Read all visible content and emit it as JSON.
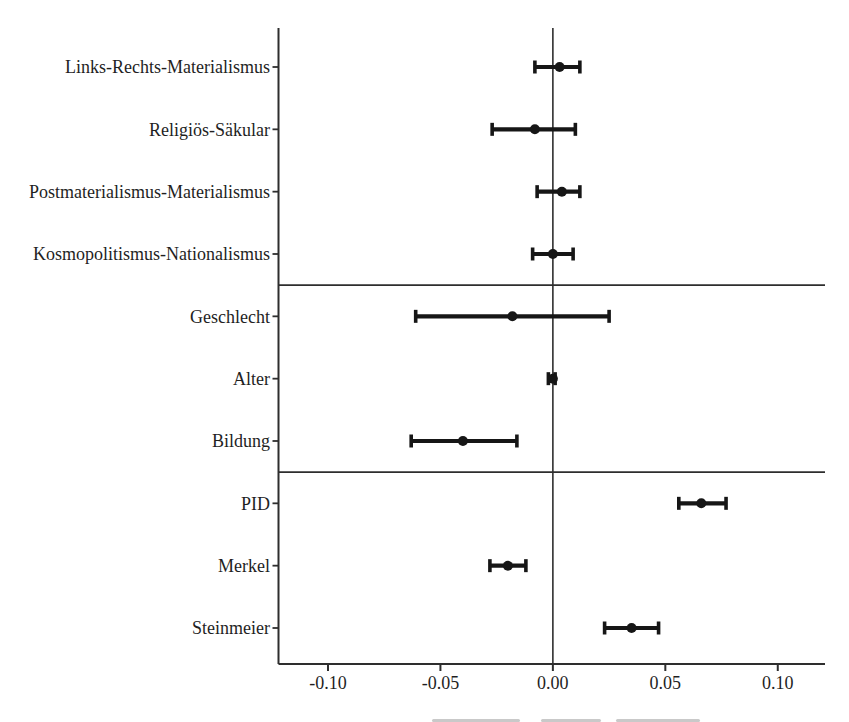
{
  "figure": {
    "background": "#ffffff",
    "ink_color": "#161616",
    "axis_line_color": "#2e2e2e",
    "text_color": "#1f1f1f"
  },
  "chart_data": {
    "type": "forest",
    "title": "",
    "xlabel": "",
    "ylabel": "",
    "grid": false,
    "legend": null,
    "xlim": [
      -0.122,
      0.121
    ],
    "x_ticks": [
      -0.1,
      -0.05,
      0.0,
      0.05,
      0.1
    ],
    "x_tick_labels": [
      "-0.10",
      "-0.05",
      "0.00",
      "0.05",
      "0.10"
    ],
    "zero_reference_line": 0.0,
    "groups": [
      {
        "rows": [
          {
            "label": "Links-Rechts-Materialismus",
            "estimate": 0.003,
            "ci_low": -0.008,
            "ci_high": 0.012
          },
          {
            "label": "Religiös-Säkular",
            "estimate": -0.008,
            "ci_low": -0.027,
            "ci_high": 0.01
          },
          {
            "label": "Postmaterialismus-Materialismus",
            "estimate": 0.004,
            "ci_low": -0.007,
            "ci_high": 0.012
          },
          {
            "label": "Kosmopolitismus-Nationalismus",
            "estimate": 0.0,
            "ci_low": -0.009,
            "ci_high": 0.009
          }
        ]
      },
      {
        "rows": [
          {
            "label": "Geschlecht",
            "estimate": -0.018,
            "ci_low": -0.061,
            "ci_high": 0.025
          },
          {
            "label": "Alter",
            "estimate": 0.0,
            "ci_low": -0.002,
            "ci_high": 0.001
          },
          {
            "label": "Bildung",
            "estimate": -0.04,
            "ci_low": -0.063,
            "ci_high": -0.016
          }
        ]
      },
      {
        "rows": [
          {
            "label": "PID",
            "estimate": 0.066,
            "ci_low": 0.056,
            "ci_high": 0.077
          },
          {
            "label": "Merkel",
            "estimate": -0.02,
            "ci_low": -0.028,
            "ci_high": -0.012
          },
          {
            "label": "Steinmeier",
            "estimate": 0.035,
            "ci_low": 0.023,
            "ci_high": 0.047
          }
        ]
      }
    ]
  }
}
